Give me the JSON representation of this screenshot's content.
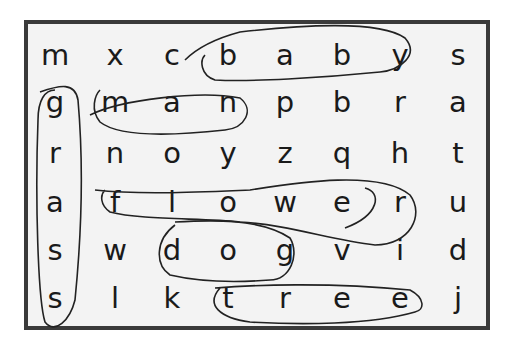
{
  "puzzle": {
    "type": "word-search",
    "rows": 6,
    "cols": 8,
    "grid": [
      [
        "m",
        "x",
        "c",
        "b",
        "a",
        "b",
        "y",
        "s"
      ],
      [
        "g",
        "m",
        "a",
        "n",
        "p",
        "b",
        "r",
        "a"
      ],
      [
        "r",
        "n",
        "o",
        "y",
        "z",
        "q",
        "h",
        "t"
      ],
      [
        "a",
        "f",
        "l",
        "o",
        "w",
        "e",
        "r",
        "u"
      ],
      [
        "s",
        "w",
        "d",
        "o",
        "g",
        "v",
        "i",
        "d"
      ],
      [
        "s",
        "l",
        "k",
        "t",
        "r",
        "e",
        "e",
        "j"
      ]
    ],
    "circled_words": [
      {
        "word": "baby",
        "direction": "horizontal",
        "row": 0,
        "start_col": 3,
        "end_col": 6
      },
      {
        "word": "man",
        "direction": "horizontal",
        "row": 1,
        "start_col": 1,
        "end_col": 3
      },
      {
        "word": "flower",
        "direction": "horizontal",
        "row": 3,
        "start_col": 1,
        "end_col": 6
      },
      {
        "word": "dog",
        "direction": "horizontal",
        "row": 4,
        "start_col": 2,
        "end_col": 4
      },
      {
        "word": "tree",
        "direction": "horizontal",
        "row": 5,
        "start_col": 3,
        "end_col": 6
      },
      {
        "word": "grass",
        "direction": "vertical",
        "col": 0,
        "start_row": 1,
        "end_row": 5
      }
    ]
  },
  "colors": {
    "border": "#3a3a3a",
    "background": "#f3f3f3",
    "ink": "#1a1a1a"
  }
}
